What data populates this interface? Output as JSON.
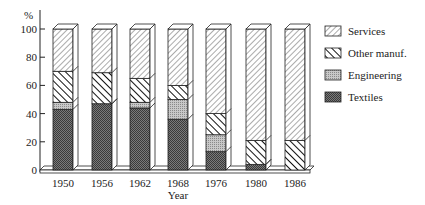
{
  "chart_data": {
    "type": "bar",
    "stacked": true,
    "style": "3d",
    "title": "",
    "xlabel": "Year",
    "ylabel": "%",
    "ylim": [
      0,
      100
    ],
    "yticks": [
      0,
      20,
      40,
      60,
      80,
      100
    ],
    "categories": [
      "1950",
      "1956",
      "1962",
      "1968",
      "1976",
      "1980",
      "1986"
    ],
    "series": [
      {
        "name": "Textiles",
        "pattern": "dense-crosshatch",
        "color": "#555555",
        "values": [
          43,
          47,
          44,
          36,
          13,
          4,
          0
        ]
      },
      {
        "name": "Engineering",
        "pattern": "light-dots",
        "color": "#aaaaaa",
        "values": [
          5,
          0,
          4,
          14,
          12,
          0,
          0
        ]
      },
      {
        "name": "Other manuf.",
        "pattern": "bold-diagonal",
        "color": "#222222",
        "values": [
          22,
          22,
          17,
          10,
          15,
          17,
          21
        ]
      },
      {
        "name": "Services",
        "pattern": "thin-diagonal",
        "color": "#666666",
        "values": [
          30,
          31,
          35,
          40,
          60,
          79,
          79
        ]
      }
    ],
    "legend": {
      "position": "right",
      "entries": [
        "Services",
        "Other manuf.",
        "Engineering",
        "Textiles"
      ]
    },
    "grid": false
  }
}
